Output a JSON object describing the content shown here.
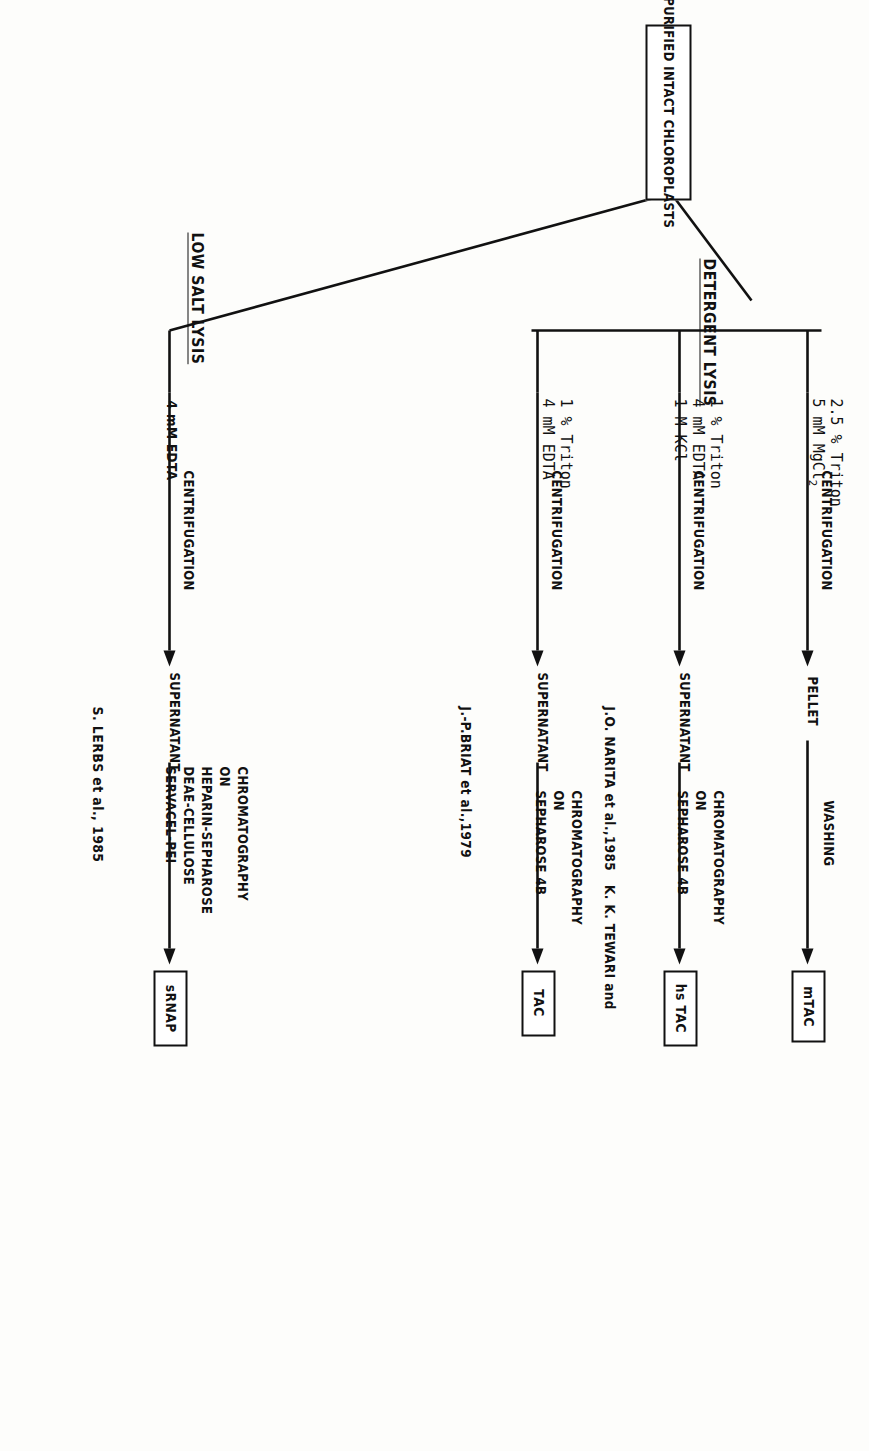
{
  "figure": {
    "type": "flowchart",
    "orientation": "rotated-90"
  },
  "source_box": {
    "label": "PURIFIED INTACT CHLOROPLASTS"
  },
  "branch_headings": {
    "detergent": "DETERGENT LYSIS",
    "low_salt": "LOW SALT LYSIS"
  },
  "columns": [
    {
      "id": "tac",
      "branch": "DETERGENT LYSIS",
      "reagents": [
        "1 % Triton",
        "4 mM EDTA"
      ],
      "step1": "CENTRIFUGATION",
      "intermediate": "SUPERNATANT",
      "step2": [
        "CHROMATOGRAPHY",
        "ON",
        "SEPHAROSE 4B"
      ],
      "product": "TAC",
      "citation": "J.-P.BRIAT et al.,1979"
    },
    {
      "id": "hstac",
      "branch": "DETERGENT LYSIS",
      "reagents": [
        "1 % Triton",
        "4 mM EDTA",
        "1 M KCl"
      ],
      "step1": "CENTRIFUGATION",
      "intermediate": "SUPERNATANT",
      "step2": [
        "CHROMATOGRAPHY",
        "ON",
        "SEPHAROSE 4B"
      ],
      "product": "hs TAC",
      "citation": "J.O. NARITA et al.,1985   K. K. TEWARI and"
    },
    {
      "id": "mtac",
      "branch": "DETERGENT LYSIS",
      "reagents": [
        "2.5 % Triton",
        "5 mM MgCl2"
      ],
      "reagents_html": [
        "2.5 % Triton",
        "5 mM MgCl<sub>2</sub>"
      ],
      "step1": "CENTRIFUGATION",
      "intermediate": "PELLET",
      "step2": [
        "WASHING"
      ],
      "product": "mTAC",
      "citation": ""
    },
    {
      "id": "srnap",
      "branch": "LOW SALT LYSIS",
      "reagents": [
        "4 mM EDTA"
      ],
      "step1": "CENTRIFUGATION",
      "intermediate": "SUPERNATANT",
      "step2": [
        "CHROMATOGRAPHY",
        "ON",
        "HEPARIN-SEPHAROSE",
        "DEAE-CELLULOSE",
        "SERVACEL-PEI"
      ],
      "product": "sRNAP",
      "citation": "S. LERBS et al., 1985"
    }
  ]
}
